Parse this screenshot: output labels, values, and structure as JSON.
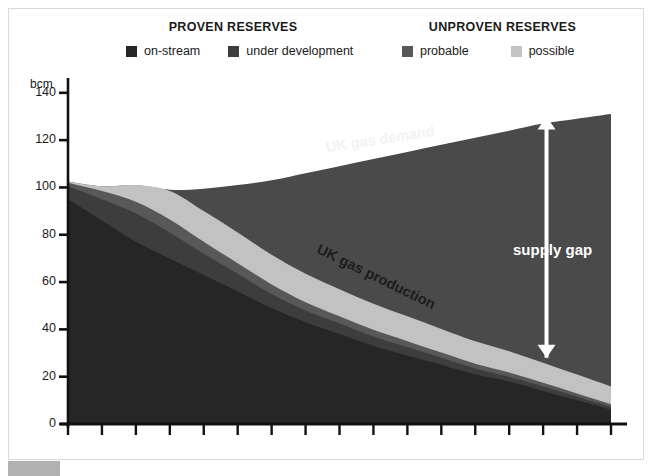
{
  "legend": {
    "groups": [
      {
        "title": "PROVEN RESERVES",
        "items": [
          {
            "label": "on-stream",
            "color": "#262626"
          },
          {
            "label": "under development",
            "color": "#3d3d3d"
          }
        ]
      },
      {
        "title": "UNPROVEN RESERVES",
        "items": [
          {
            "label": "probable",
            "color": "#585858"
          },
          {
            "label": "possible",
            "color": "#c2c2c2"
          }
        ]
      }
    ]
  },
  "axis": {
    "unit_label": "bcm",
    "y_ticks": [
      "0",
      "20",
      "40",
      "60",
      "80",
      "100",
      "120",
      "140"
    ]
  },
  "annotations": {
    "demand": "UK gas demand",
    "production": "UK gas production",
    "supply_gap": "supply gap"
  },
  "chart_data": {
    "type": "area",
    "title": "",
    "subtitle": "",
    "xlabel": "",
    "ylabel": "bcm",
    "ylim": [
      0,
      145
    ],
    "yticks": [
      0,
      20,
      40,
      60,
      80,
      100,
      120,
      140
    ],
    "grid": false,
    "legend_position": "top",
    "x_tick_count": 17,
    "x_tick_labels": [],
    "x": [
      0,
      1,
      2,
      3,
      4,
      5,
      6,
      7,
      8,
      9,
      10,
      11,
      12,
      13,
      14,
      15,
      16
    ],
    "series": [
      {
        "name": "on-stream",
        "color": "#262626",
        "stack": "production",
        "values": [
          95,
          86,
          77,
          70,
          63,
          56,
          49,
          43,
          38,
          33,
          29,
          25,
          21,
          18,
          14,
          10,
          6
        ]
      },
      {
        "name": "under development",
        "color": "#3d3d3d",
        "stack": "production",
        "values": [
          5.5,
          9,
          12,
          11,
          9,
          7.5,
          6,
          5,
          4.5,
          4,
          3.5,
          3,
          2.5,
          2,
          1.8,
          1.5,
          1.2
        ]
      },
      {
        "name": "probable",
        "color": "#585858",
        "stack": "production",
        "values": [
          1.5,
          3.5,
          5,
          5.5,
          5,
          4.5,
          4,
          3.5,
          3,
          2.8,
          2.5,
          2.2,
          2,
          1.8,
          1.6,
          1.4,
          1.2
        ]
      },
      {
        "name": "possible",
        "color": "#c2c2c2",
        "stack": "production",
        "values": [
          0.5,
          2,
          7,
          12,
          13,
          13,
          12.5,
          12,
          11.5,
          11,
          10.5,
          10,
          9.5,
          9,
          8.5,
          8,
          7.5
        ]
      }
    ],
    "production_total": [
      102.5,
      100.5,
      101,
      98.5,
      90,
      81,
      71.5,
      63.5,
      57,
      50.8,
      45.5,
      40.2,
      35,
      30.8,
      25.9,
      20.9,
      15.9
    ],
    "demand_line": {
      "name": "UK gas demand",
      "color": "#4a4a4a",
      "values": [
        102.5,
        100.5,
        101,
        99,
        99.5,
        101,
        103,
        106,
        109,
        112,
        115,
        118,
        121,
        124,
        127,
        129,
        131
      ]
    },
    "supply_gap_marker": {
      "label": "supply gap",
      "x_index": 14.1,
      "from": 28,
      "to": 130
    }
  }
}
